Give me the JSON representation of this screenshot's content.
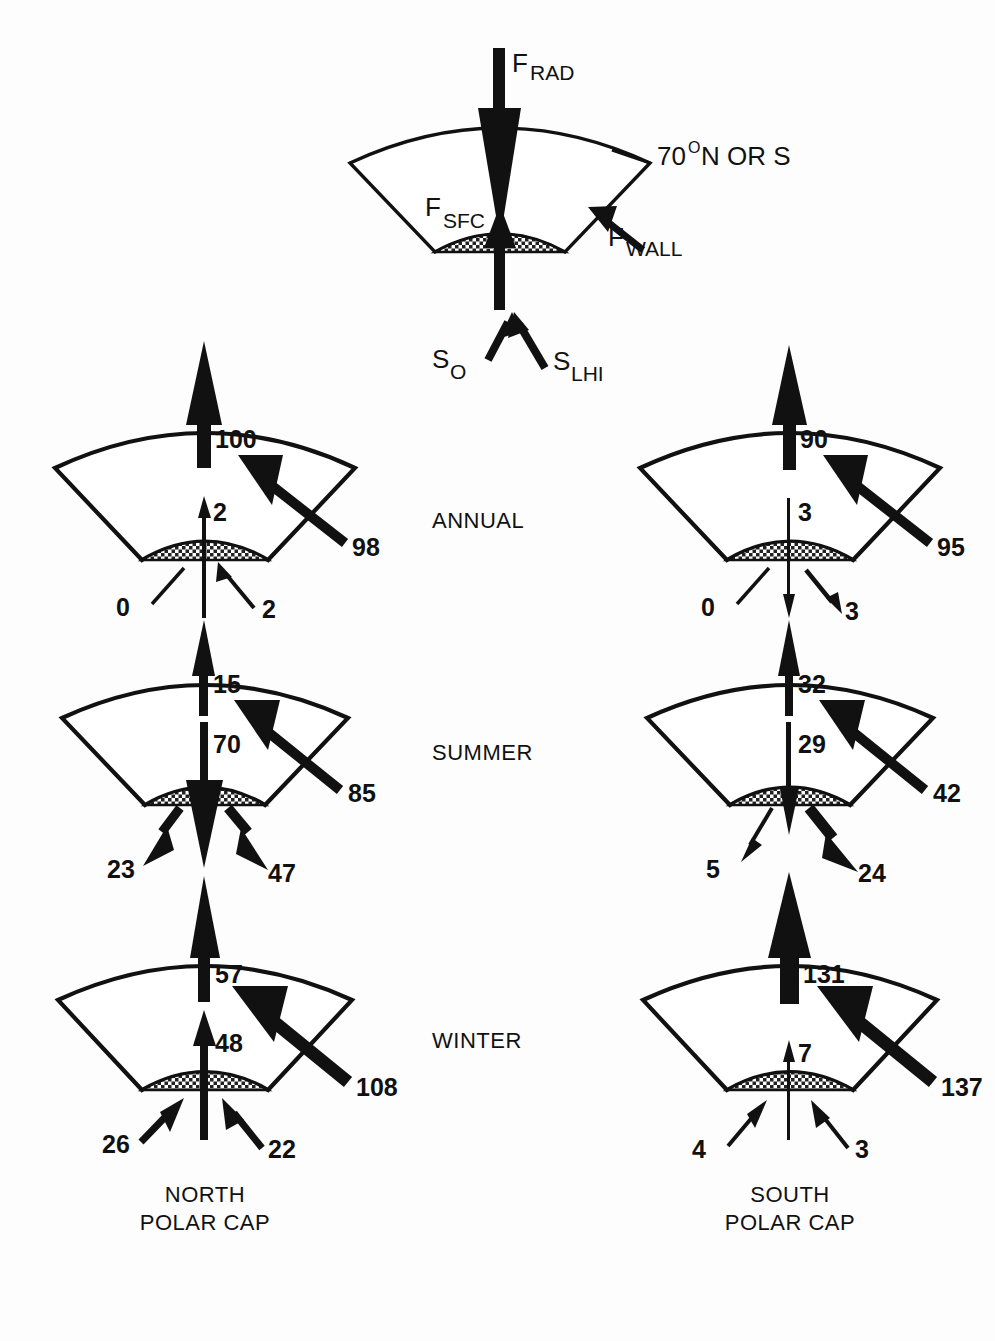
{
  "figure": {
    "type": "diagram",
    "key_panel": {
      "labels": {
        "f_rad_main": "F",
        "f_rad_sub": "RAD",
        "f_sfc_main": "F",
        "f_sfc_sub": "SFC",
        "f_wall_main": "F",
        "f_wall_sub": "WALL",
        "latitude": "70",
        "latitude_deg": "O",
        "latitude_tail": "N OR S",
        "s_o_main": "S",
        "s_o_sub": "O",
        "s_lhi_main": "S",
        "s_lhi_sub": "LHI"
      }
    },
    "row_labels": [
      "ANNUAL",
      "SUMMER",
      "WINTER"
    ],
    "column_captions": [
      {
        "line1": "NORTH",
        "line2": "POLAR CAP"
      },
      {
        "line1": "SOUTH",
        "line2": "POLAR CAP"
      }
    ],
    "panels": [
      {
        "cap": "north",
        "season": "ANNUAL",
        "f_rad": "100",
        "f_rad_dir": "up",
        "f_rad_weight": "thick",
        "f_sfc": "2",
        "f_sfc_dir": "up",
        "f_sfc_weight": "thin",
        "f_wall": "98",
        "f_wall_dir": "in",
        "f_wall_weight": "thick",
        "s_o": "0",
        "s_o_dir": "up-in",
        "s_o_weight": "hairline-noheads",
        "s_lhi": "2",
        "s_lhi_dir": "up-in",
        "s_lhi_weight": "thin"
      },
      {
        "cap": "north",
        "season": "SUMMER",
        "f_rad": "15",
        "f_rad_dir": "up",
        "f_rad_weight": "thin",
        "f_sfc": "70",
        "f_sfc_dir": "down",
        "f_sfc_weight": "thick",
        "f_wall": "85",
        "f_wall_dir": "in",
        "f_wall_weight": "thick",
        "s_o": "23",
        "s_o_dir": "down-out",
        "s_o_weight": "thick",
        "s_lhi": "47",
        "s_lhi_dir": "down-out",
        "s_lhi_weight": "thick"
      },
      {
        "cap": "north",
        "season": "WINTER",
        "f_rad": "57",
        "f_rad_dir": "up",
        "f_rad_weight": "thick",
        "f_sfc": "48",
        "f_sfc_dir": "up",
        "f_sfc_weight": "medium",
        "f_wall": "108",
        "f_wall_dir": "in",
        "f_wall_weight": "extra-thick",
        "s_o": "26",
        "s_o_dir": "up-in",
        "s_o_weight": "medium",
        "s_lhi": "22",
        "s_lhi_dir": "up-in",
        "s_lhi_weight": "medium"
      },
      {
        "cap": "south",
        "season": "ANNUAL",
        "f_rad": "90",
        "f_rad_dir": "up",
        "f_rad_weight": "thick",
        "f_sfc": "3",
        "f_sfc_dir": "down",
        "f_sfc_weight": "hairline",
        "f_wall": "95",
        "f_wall_dir": "in",
        "f_wall_weight": "thick",
        "s_o": "0",
        "s_o_dir": "up-in",
        "s_o_weight": "hairline-noheads",
        "s_lhi": "3",
        "s_lhi_dir": "down-out",
        "s_lhi_weight": "thin"
      },
      {
        "cap": "south",
        "season": "SUMMER",
        "f_rad": "32",
        "f_rad_dir": "up",
        "f_rad_weight": "thin",
        "f_sfc": "29",
        "f_sfc_dir": "down",
        "f_sfc_weight": "thin",
        "f_wall": "42",
        "f_wall_dir": "in",
        "f_wall_weight": "thick",
        "s_o": "5",
        "s_o_dir": "down-out",
        "s_o_weight": "hairline",
        "s_lhi": "24",
        "s_lhi_dir": "down-out",
        "s_lhi_weight": "thick"
      },
      {
        "cap": "south",
        "season": "WINTER",
        "f_rad": "131",
        "f_rad_dir": "up",
        "f_rad_weight": "extra-thick",
        "f_sfc": "7",
        "f_sfc_dir": "up",
        "f_sfc_weight": "hairline",
        "f_wall": "137",
        "f_wall_dir": "in",
        "f_wall_weight": "extra-thick",
        "s_o": "4",
        "s_o_dir": "up-in",
        "s_o_weight": "hairline",
        "s_lhi": "3",
        "s_lhi_dir": "up-in",
        "s_lhi_weight": "hairline"
      }
    ],
    "colors": {
      "ink": "#111111",
      "paper": "#ffffff"
    }
  }
}
